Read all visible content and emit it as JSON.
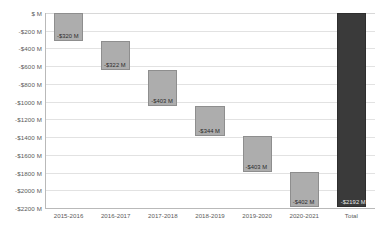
{
  "chart_data": {
    "type": "bar",
    "subtype": "waterfall",
    "title": "",
    "xlabel": "",
    "ylabel": "",
    "categories": [
      "2015-2016",
      "2016-2017",
      "2017-2018",
      "2018-2019",
      "2019-2020",
      "2020-2021",
      "Total"
    ],
    "values": [
      -320,
      -322,
      -403,
      -344,
      -403,
      -402,
      -2192
    ],
    "data_labels": [
      "-$320 M",
      "-$322 M",
      "-$403 M",
      "-$344 M",
      "-$403 M",
      "-$402 M",
      "-$2192 M"
    ],
    "cumulative_start": [
      0,
      -320,
      -642,
      -1045,
      -1389,
      -1792,
      0
    ],
    "cumulative_end": [
      -320,
      -642,
      -1045,
      -1389,
      -1792,
      -2194,
      -2192
    ],
    "is_total": [
      false,
      false,
      false,
      false,
      false,
      false,
      true
    ],
    "ylim": [
      -2200,
      0
    ],
    "y_tick_values": [
      0,
      -200,
      -400,
      -600,
      -800,
      -1000,
      -1200,
      -1400,
      -1600,
      -1800,
      -2000,
      -2200
    ],
    "y_tick_labels": [
      "$ M",
      "-$200 M",
      "-$400 M",
      "-$600 M",
      "-$800 M",
      "-$1000 M",
      "-$1200 M",
      "-$1400 M",
      "-$1600 M",
      "-$1800 M",
      "-$2000 M",
      "-$2200 M"
    ],
    "grid": true,
    "legend": "none",
    "colors": {
      "step_bar": "#adadad",
      "step_bar_border": "#8e8e8e",
      "total_bar": "#3a3a3a",
      "gridline": "#e2e2e2",
      "axis": "#b9b9b9",
      "tick_text": "#5a5a5a",
      "label_text": "#2b2b2b",
      "total_label_text": "#e9e9e9",
      "background": "#ffffff"
    }
  }
}
